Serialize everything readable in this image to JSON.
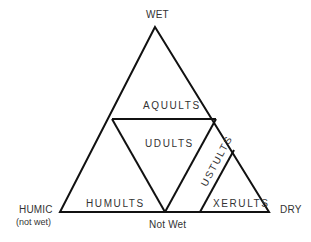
{
  "diagram": {
    "corners": {
      "top": "WET",
      "left": "HUMIC",
      "left_sub": "(not wet)",
      "right": "DRY",
      "bottom": "Not Wet"
    },
    "regions": [
      {
        "label": "AQUULTS"
      },
      {
        "label": "UDULTS"
      },
      {
        "label": "USTULTS"
      },
      {
        "label": "XERULTS"
      },
      {
        "label": "HUMULTS"
      }
    ],
    "colors": {
      "line": "#111111",
      "text": "#333333",
      "background": "#ffffff"
    }
  }
}
